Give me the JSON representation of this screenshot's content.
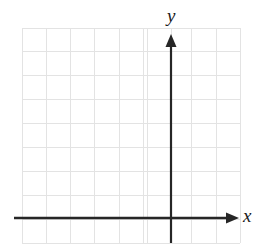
{
  "figure": {
    "title": "",
    "background_color": "#ffffff",
    "width": 262,
    "height": 252
  },
  "axes": {
    "x": {
      "label": "x",
      "icon": "arrow-right-icon",
      "color": "#262626",
      "line": {
        "x1": 14,
        "y1": 218,
        "x2": 228,
        "y2": 218
      },
      "arrow_tip_x": 239,
      "label_position": {
        "left": 243,
        "top": 206
      }
    },
    "y": {
      "label": "y",
      "icon": "arrow-up-icon",
      "color": "#262626",
      "line": {
        "x1": 171,
        "y1": 243,
        "x2": 171,
        "y2": 46
      },
      "arrow_tip_y": 34,
      "label_position": {
        "left": 167,
        "top": 6
      }
    }
  },
  "grid": {
    "color": "#e3e3e3",
    "line_width": 1,
    "left": 22,
    "top": 28,
    "right": 240,
    "bottom": 243,
    "x_lines": [
      22,
      46.3,
      70.5,
      94.8,
      119,
      143.3,
      147.5,
      171,
      191.8,
      216,
      240
    ],
    "y_lines": [
      28,
      51.9,
      75.8,
      99.7,
      123.6,
      147.5,
      171.4,
      195.3,
      219.2,
      243
    ],
    "columns": 9,
    "rows": 9
  },
  "chart_data": {
    "type": "line",
    "title": "",
    "xlabel": "x",
    "ylabel": "y",
    "series": [],
    "x": [],
    "values": [],
    "xlim": [
      -6.1,
      2.8
    ],
    "ylim": [
      -1,
      7.8
    ],
    "grid": true,
    "legend": "none",
    "annotations": []
  }
}
